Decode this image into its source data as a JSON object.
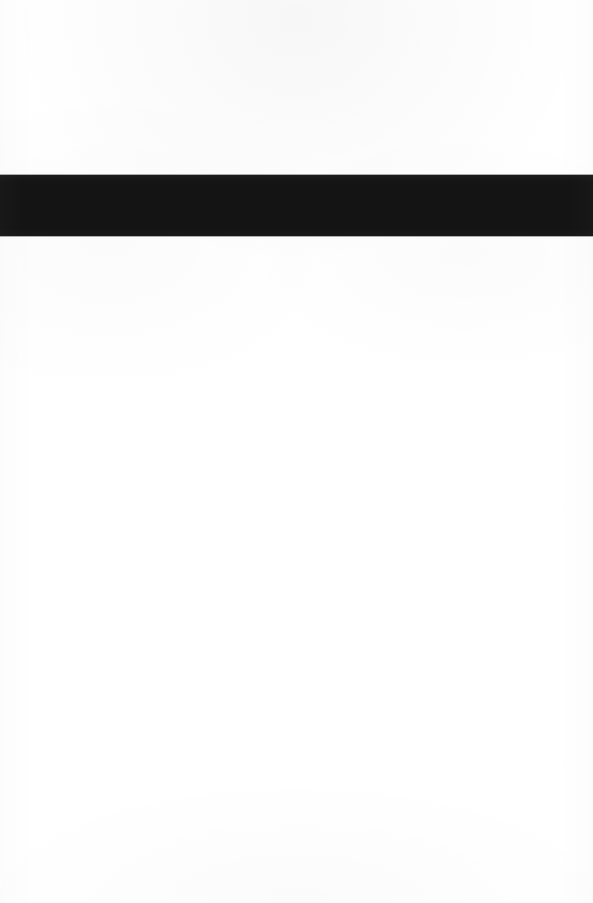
{
  "page": {
    "width_px": 593,
    "height_px": 903,
    "background_color": "#ffffff",
    "visible_text": "",
    "content_summary": ""
  },
  "redaction_bar": {
    "label": "",
    "color": "#141414",
    "x_px": 0,
    "y_px": 175,
    "width_px": 593,
    "height_px": 61
  },
  "regions": {
    "top_blank": {
      "label": "",
      "y_px": 0,
      "height_px": 175
    },
    "bottom_blank": {
      "label": "",
      "y_px": 236,
      "height_px": 667
    }
  }
}
